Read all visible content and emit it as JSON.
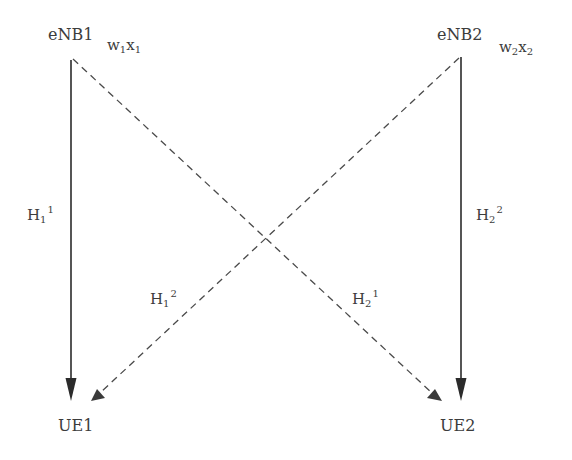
{
  "nodes": {
    "enb1": {
      "label": "eNB1",
      "weight": {
        "w": "w",
        "w_sub": "1",
        "x": "x",
        "x_sub": "1"
      }
    },
    "enb2": {
      "label": "eNB2",
      "weight": {
        "w": "w",
        "w_sub": "2",
        "x": "x",
        "x_sub": "2"
      }
    },
    "ue1": {
      "label": "UE1"
    },
    "ue2": {
      "label": "UE2"
    }
  },
  "channels": {
    "h11": {
      "base": "H",
      "sub": "1",
      "sup": "1",
      "style": "solid",
      "from": "eNB1",
      "to": "UE1"
    },
    "h22": {
      "base": "H",
      "sub": "2",
      "sup": "2",
      "style": "solid",
      "from": "eNB2",
      "to": "UE2"
    },
    "h12": {
      "base": "H",
      "sub": "1",
      "sup": "2",
      "style": "dashed",
      "from": "eNB2",
      "to": "UE1"
    },
    "h21": {
      "base": "H",
      "sub": "2",
      "sup": "1",
      "style": "dashed",
      "from": "eNB1",
      "to": "UE2"
    }
  },
  "colors": {
    "line": "#2b2b2b",
    "dashed": "#4a4a4a",
    "text": "#3c3c3c"
  }
}
